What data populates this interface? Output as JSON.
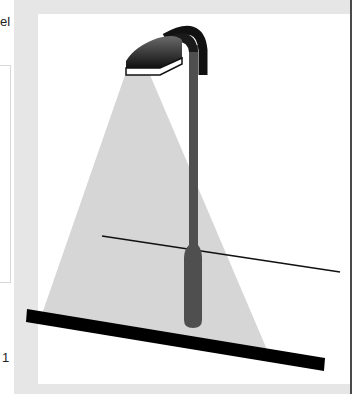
{
  "left_panel": {
    "top_text": "el",
    "bottom_text": "1"
  },
  "illustration": {
    "subject": "street lamp casting a cone of light onto the ground",
    "icon": "street-lamp-icon",
    "colors": {
      "pole": "#4f4f4f",
      "lamp_head": "#1e1e1e",
      "light_cone": "#d6d6d6",
      "ground": "#000000",
      "frame": "#e6e6e6",
      "right_rule": "#4a4a4a"
    }
  }
}
